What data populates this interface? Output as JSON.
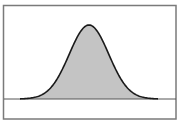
{
  "chart_data": {
    "type": "area",
    "title": "",
    "xlabel": "",
    "ylabel": "",
    "grid": false,
    "legend": null,
    "distribution": {
      "mean": 0,
      "std": 1
    },
    "x": [
      -3.5,
      -3,
      -2.5,
      -2,
      -1.5,
      -1,
      -0.5,
      0,
      0.5,
      1,
      1.5,
      2,
      2.5,
      3,
      3.5
    ],
    "values": [
      0.0009,
      0.0044,
      0.0175,
      0.054,
      0.1295,
      0.242,
      0.3521,
      0.3989,
      0.3521,
      0.242,
      0.1295,
      0.054,
      0.0175,
      0.0044,
      0.0009
    ],
    "xlim": [
      -3.5,
      3.5
    ],
    "ylim": [
      0,
      0.4
    ]
  },
  "style": {
    "frame_color": "#7a7a7a",
    "fill_color": "#c4c4c4",
    "curve_color": "#1a1a1a",
    "baseline_color": "#555555",
    "background": "#ffffff"
  }
}
